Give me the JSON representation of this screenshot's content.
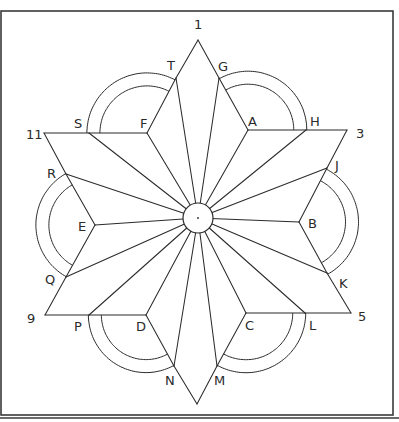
{
  "figure": {
    "line_color": "#2b2b2b",
    "background": "#ffffff",
    "number_labels": [
      "1",
      "3",
      "5",
      "9",
      "11"
    ],
    "center_mark": "·",
    "points": {
      "1": {
        "label": "1"
      },
      "3": {
        "label": "3"
      },
      "5": {
        "label": "5"
      },
      "9": {
        "label": "9"
      },
      "11": {
        "label": "11"
      },
      "A": {
        "label": "A"
      },
      "B": {
        "label": "B"
      },
      "C": {
        "label": "C"
      },
      "D": {
        "label": "D"
      },
      "E": {
        "label": "E"
      },
      "F": {
        "label": "F"
      },
      "G": {
        "label": "G"
      },
      "H": {
        "label": "H"
      },
      "J": {
        "label": "J"
      },
      "K": {
        "label": "K"
      },
      "L": {
        "label": "L"
      },
      "M": {
        "label": "M"
      },
      "N": {
        "label": "N"
      },
      "P": {
        "label": "P"
      },
      "Q": {
        "label": "Q"
      },
      "R": {
        "label": "R"
      },
      "S": {
        "label": "S"
      },
      "T": {
        "label": "T"
      }
    },
    "arc_pairs": [
      {
        "from": "S",
        "to": "T",
        "center": "F"
      },
      {
        "from": "G",
        "to": "H",
        "center": "A"
      },
      {
        "from": "J",
        "to": "K",
        "center": "B"
      },
      {
        "from": "L",
        "to": "M",
        "center": "C"
      },
      {
        "from": "N",
        "to": "P",
        "center": "D"
      },
      {
        "from": "Q",
        "to": "R",
        "center": "E"
      }
    ]
  }
}
